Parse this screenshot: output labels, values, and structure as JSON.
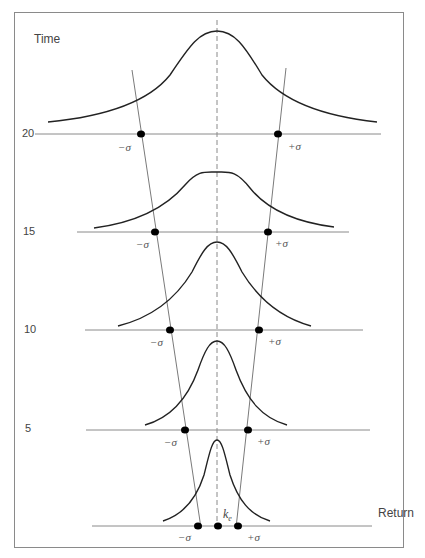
{
  "diagram": {
    "y_axis_label": "Time",
    "x_axis_label": "Return",
    "center_label_main": "k",
    "center_label_sub": "e",
    "minus_sigma": "−σ",
    "plus_sigma": "+σ",
    "levels": [
      {
        "time": "20",
        "label": "20"
      },
      {
        "time": "15",
        "label": "15"
      },
      {
        "time": "10",
        "label": "10"
      },
      {
        "time": "5",
        "label": "5"
      },
      {
        "time": "0",
        "label": ""
      }
    ],
    "colors": {
      "curve": "#222222",
      "axis_line": "#8a8a8a",
      "dashed_line": "#8a8a8a",
      "dot": "#000000",
      "frame": "#8a8a8a"
    }
  }
}
